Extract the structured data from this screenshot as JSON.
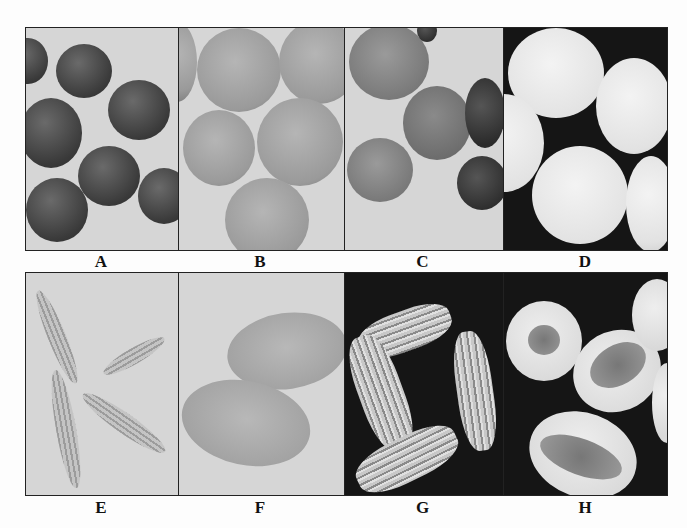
{
  "figure": {
    "panels": [
      {
        "label": "A",
        "row": "top",
        "background": "light",
        "subject": "dark-round-seeds"
      },
      {
        "label": "B",
        "row": "top",
        "background": "light",
        "subject": "speckled-round-seeds"
      },
      {
        "label": "C",
        "row": "top",
        "background": "light",
        "subject": "split-seeds-with-coats"
      },
      {
        "label": "D",
        "row": "top",
        "background": "dark",
        "subject": "white-spherical-seeds"
      },
      {
        "label": "E",
        "row": "bottom",
        "background": "light",
        "subject": "ribbed-slender-seeds"
      },
      {
        "label": "F",
        "row": "bottom",
        "background": "light",
        "subject": "smooth-oval-seeds"
      },
      {
        "label": "G",
        "row": "bottom",
        "background": "dark",
        "subject": "ridged-elongated-seeds"
      },
      {
        "label": "H",
        "row": "bottom",
        "background": "dark",
        "subject": "cut-seeds-showing-interior"
      }
    ]
  }
}
